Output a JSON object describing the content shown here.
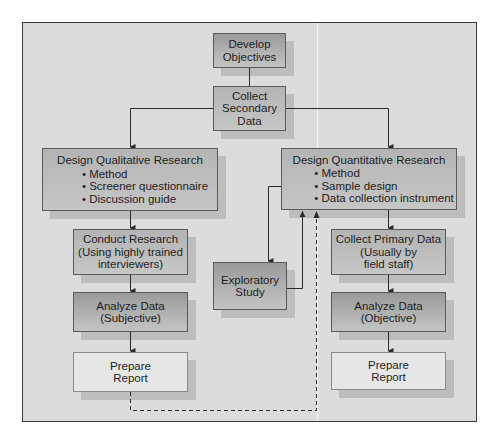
{
  "diagram": {
    "type": "flowchart",
    "nodes": {
      "develop_objectives": {
        "lines": [
          "Develop",
          "Objectives"
        ]
      },
      "collect_secondary": {
        "lines": [
          "Collect",
          "Secondary",
          "Data"
        ]
      },
      "design_qualitative": {
        "title": "Design Qualitative Research",
        "bullets": [
          "• Method",
          "• Screener questionnaire",
          "• Discussion guide"
        ]
      },
      "design_quantitative": {
        "title": "Design Quantitative Research",
        "bullets": [
          "• Method",
          "• Sample design",
          "• Data collection instrument"
        ]
      },
      "conduct_research": {
        "lines": [
          "Conduct Research",
          "(Using highly trained",
          "interviewers)"
        ]
      },
      "exploratory_study": {
        "lines": [
          "Exploratory",
          "Study"
        ]
      },
      "collect_primary": {
        "lines": [
          "Collect Primary Data",
          "(Usually by",
          "field staff)"
        ]
      },
      "analyze_subjective": {
        "lines": [
          "Analyze Data",
          "(Subjective)"
        ]
      },
      "analyze_objective": {
        "lines": [
          "Analyze Data",
          "(Objective)"
        ]
      },
      "prepare_report_left": {
        "lines": [
          "Prepare",
          "Report"
        ]
      },
      "prepare_report_right": {
        "lines": [
          "Prepare",
          "Report"
        ]
      }
    },
    "edges": [
      {
        "from": "Develop Objectives",
        "to": "Collect Secondary Data",
        "style": "solid"
      },
      {
        "from": "Collect Secondary Data",
        "to": "Design Qualitative Research",
        "style": "solid-arrow"
      },
      {
        "from": "Collect Secondary Data",
        "to": "Design Quantitative Research",
        "style": "solid-arrow"
      },
      {
        "from": "Design Qualitative Research",
        "to": "Conduct Research",
        "style": "solid-arrow"
      },
      {
        "from": "Conduct Research",
        "to": "Analyze Data (Subjective)",
        "style": "solid-arrow"
      },
      {
        "from": "Analyze Data (Subjective)",
        "to": "Prepare Report (left)",
        "style": "solid-arrow"
      },
      {
        "from": "Design Quantitative Research",
        "to": "Exploratory Study",
        "style": "solid-arrow"
      },
      {
        "from": "Exploratory Study",
        "to": "Design Quantitative Research",
        "style": "solid-arrow"
      },
      {
        "from": "Prepare Report (left)",
        "to": "Design Quantitative Research",
        "style": "dashed-arrow"
      },
      {
        "from": "Design Quantitative Research",
        "to": "Collect Primary Data",
        "style": "solid-arrow"
      },
      {
        "from": "Collect Primary Data",
        "to": "Analyze Data (Objective)",
        "style": "solid-arrow"
      },
      {
        "from": "Analyze Data (Objective)",
        "to": "Prepare Report (right)",
        "style": "solid-arrow"
      }
    ],
    "colors": {
      "frame_bg": "#dcdcdc",
      "frame_border": "#3a3a3a",
      "dark_box": "#a8a8a8",
      "mid_box": "#c0c0c0",
      "light_box": "#e6e6e6",
      "shadow": "#bdbdbd",
      "line": "#2a2a2a"
    }
  }
}
